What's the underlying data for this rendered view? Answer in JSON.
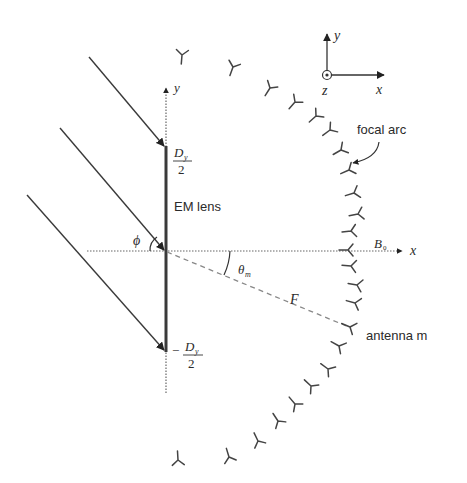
{
  "diagram": {
    "labels": {
      "em_lens": "EM lens",
      "focal_arc": "focal arc",
      "antenna_m": "antenna m",
      "lens_axis_y": "y",
      "lens_axis_x": "x",
      "triad_y": "y",
      "triad_x": "x",
      "triad_z": "z",
      "phi": "ϕ",
      "theta": "θ",
      "theta_sub": "m",
      "focal_length": "F",
      "b_main": "B",
      "b_sub": "0",
      "top_numerator": "D",
      "top_numerator_sub": "y",
      "top_denominator": "2",
      "bottom_sign": "−",
      "bottom_numerator": "D",
      "bottom_numerator_sub": "y",
      "bottom_denominator": "2"
    },
    "incident_rays": 3,
    "antenna_count": 24,
    "colors": {
      "stroke": "#3a3a3a",
      "dashed": "#8a8a8a",
      "dotted": "#6a6a6a"
    }
  }
}
